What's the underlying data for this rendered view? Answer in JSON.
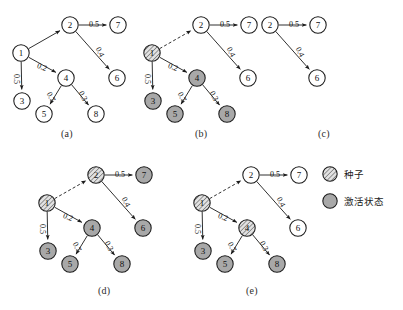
{
  "figure": {
    "panel_captions": [
      "(a)",
      "(b)",
      "(c)",
      "(d)",
      "(e)"
    ],
    "node_labels": [
      "1",
      "2",
      "3",
      "4",
      "5",
      "6",
      "7",
      "8"
    ],
    "edge_weight_labels": [
      "0.5",
      "0.5",
      "0.4",
      "0.2",
      "0.7",
      "0.3"
    ],
    "colors": {
      "node_white": "#ffffff",
      "node_gray": "#a8a8a8",
      "node_hatch_bg": "#e2e2e2",
      "node_hatch_line": "#7a7a7a",
      "stroke": "#1a1a1a",
      "background": "#ffffff"
    }
  },
  "legend": {
    "items": [
      {
        "label": "种子",
        "style": "hatched"
      },
      {
        "label": "激活状态",
        "style": "gray"
      }
    ]
  },
  "graph": {
    "nodes": [
      {
        "id": "1",
        "x": 21,
        "y": 53
      },
      {
        "id": "2",
        "x": 70,
        "y": 25
      },
      {
        "id": "3",
        "x": 22,
        "y": 101
      },
      {
        "id": "4",
        "x": 66,
        "y": 78
      },
      {
        "id": "5",
        "x": 44,
        "y": 114
      },
      {
        "id": "6",
        "x": 117,
        "y": 78
      },
      {
        "id": "7",
        "x": 118,
        "y": 25
      },
      {
        "id": "8",
        "x": 96,
        "y": 114
      }
    ],
    "edges": [
      {
        "from": "1",
        "to": "2",
        "weight": "",
        "dashed": false,
        "lx": 0,
        "ly": 0,
        "rot": 0
      },
      {
        "from": "2",
        "to": "7",
        "weight": "0.5",
        "dashed": false,
        "lx": 94,
        "ly": 24,
        "rot": 0
      },
      {
        "from": "2",
        "to": "6",
        "weight": "0.4",
        "dashed": false,
        "lx": 100,
        "ly": 52,
        "rot": 62
      },
      {
        "from": "1",
        "to": "3",
        "weight": "0.5",
        "dashed": false,
        "lx": 16,
        "ly": 79,
        "rot": 90
      },
      {
        "from": "1",
        "to": "4",
        "weight": "0.2",
        "dashed": false,
        "lx": 42,
        "ly": 67,
        "rot": 22
      },
      {
        "from": "4",
        "to": "5",
        "weight": "0.7",
        "dashed": false,
        "lx": 51,
        "ly": 97,
        "rot": 62
      },
      {
        "from": "4",
        "to": "8",
        "weight": "0.3",
        "dashed": false,
        "lx": 83,
        "ly": 96,
        "rot": 62
      }
    ]
  },
  "panels": [
    {
      "caption": "(a)",
      "caption_x": 61,
      "caption_y": 133,
      "origin_x": 0,
      "origin_y": 0,
      "visible_nodes": [
        "1",
        "2",
        "3",
        "4",
        "5",
        "6",
        "7",
        "8"
      ],
      "seed_nodes": [],
      "active_nodes": [],
      "dashed_edges": []
    },
    {
      "caption": "(b)",
      "caption_x": 195,
      "caption_y": 133,
      "origin_x": 131,
      "origin_y": 0,
      "visible_nodes": [
        "1",
        "2",
        "3",
        "4",
        "5",
        "6",
        "7",
        "8"
      ],
      "seed_nodes": [
        "1"
      ],
      "active_nodes": [
        "3",
        "4",
        "5",
        "8"
      ],
      "dashed_edges": [
        "1-2"
      ]
    },
    {
      "caption": "(c)",
      "caption_x": 318,
      "caption_y": 133,
      "origin_x": 200,
      "origin_y": 0,
      "visible_nodes": [
        "2",
        "6",
        "7"
      ],
      "seed_nodes": [],
      "active_nodes": [],
      "dashed_edges": []
    },
    {
      "caption": "(d)",
      "caption_x": 98,
      "caption_y": 290,
      "origin_x": 26,
      "origin_y": 150,
      "visible_nodes": [
        "1",
        "2",
        "3",
        "4",
        "5",
        "6",
        "7",
        "8"
      ],
      "seed_nodes": [
        "1",
        "2"
      ],
      "active_nodes": [
        "3",
        "4",
        "5",
        "6",
        "7",
        "8"
      ],
      "dashed_edges": [
        "1-2"
      ]
    },
    {
      "caption": "(e)",
      "caption_x": 246,
      "caption_y": 290,
      "origin_x": 181,
      "origin_y": 150,
      "visible_nodes": [
        "1",
        "2",
        "3",
        "4",
        "5",
        "6",
        "7",
        "8"
      ],
      "seed_nodes": [
        "1",
        "4"
      ],
      "active_nodes": [
        "3",
        "5",
        "8"
      ],
      "dashed_edges": [
        "1-2"
      ]
    }
  ],
  "legend_layout": {
    "items": [
      {
        "cx": 330,
        "cy": 174,
        "label_x": 344,
        "label_y": 168
      },
      {
        "cx": 330,
        "cy": 201,
        "label_x": 344,
        "label_y": 195
      }
    ]
  }
}
